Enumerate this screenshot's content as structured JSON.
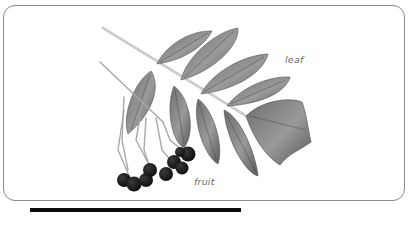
{
  "figure": {
    "labels": {
      "leaf": "leaf",
      "fruit": "fruit"
    },
    "colors": {
      "frame_border": "#8a8a8a",
      "leaf_fill": "#8c8c8c",
      "leaf_dark": "#4a4a4a",
      "berry": "#1c1c1c",
      "label_text": "#6a6a6a",
      "bottom_bar": "#0a0a0a"
    }
  }
}
